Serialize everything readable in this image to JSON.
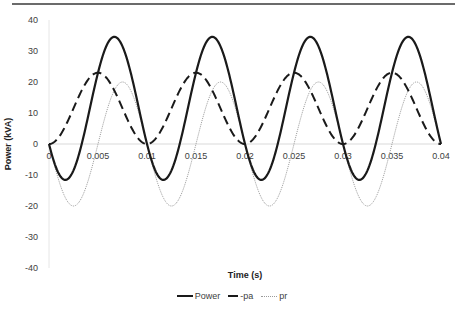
{
  "chart_data": {
    "type": "line",
    "title": "",
    "xlabel": "Time (s)",
    "ylabel": "Power (kVA)",
    "xlim": [
      0,
      0.04
    ],
    "ylim": [
      -40,
      40
    ],
    "x_ticks": [
      "0",
      "0.005",
      "0.01",
      "0.015",
      "0.02",
      "0.025",
      "0.03",
      "0.035",
      "0.04"
    ],
    "y_ticks": [
      "40",
      "30",
      "20",
      "10",
      "0",
      "-10",
      "-20",
      "-30",
      "-40"
    ],
    "grid": false,
    "legend_position": "bottom",
    "period_s": 0.01,
    "series": [
      {
        "name": "Power",
        "style": "solid",
        "color": "#1a1a1a",
        "width": 2.2,
        "description": "pa + pr; peaks ~34.5 at t≈0.0067+k·0.01, min ~-11.6 at t≈0.0017+k·0.01",
        "x": [
          0,
          0.0017,
          0.0042,
          0.0067,
          0.0092,
          0.01,
          0.0117,
          0.0142,
          0.0167,
          0.0192,
          0.02,
          0.0217,
          0.0242,
          0.0267,
          0.0292,
          0.03,
          0.0317,
          0.0342,
          0.0367,
          0.0392,
          0.04
        ],
        "values": [
          0,
          -11.6,
          11.5,
          34.6,
          11.5,
          0,
          -11.6,
          11.5,
          34.6,
          11.5,
          0,
          -11.6,
          11.5,
          34.6,
          11.5,
          0,
          -11.6,
          11.5,
          34.6,
          11.5,
          0
        ]
      },
      {
        "name": "-pa",
        "style": "dashed",
        "color": "#1a1a1a",
        "width": 2,
        "description": "11.5·(1−cos(2πt/0.01)); peak 23 at t=0.005+k·0.01",
        "x": [
          0,
          0.0025,
          0.005,
          0.0075,
          0.01,
          0.0125,
          0.015,
          0.0175,
          0.02,
          0.0225,
          0.025,
          0.0275,
          0.03,
          0.0325,
          0.035,
          0.0375,
          0.04
        ],
        "values": [
          0,
          11.5,
          23,
          11.5,
          0,
          11.5,
          23,
          11.5,
          0,
          11.5,
          23,
          11.5,
          0,
          11.5,
          23,
          11.5,
          0
        ]
      },
      {
        "name": "pr",
        "style": "dotted",
        "color": "#9a9a9a",
        "width": 1,
        "description": "−20·sin(2πt/0.01); min -20 at t=0.0025+k·0.01, max 20 at t=0.0075+k·0.01",
        "x": [
          0,
          0.0025,
          0.005,
          0.0075,
          0.01,
          0.0125,
          0.015,
          0.0175,
          0.02,
          0.0225,
          0.025,
          0.0275,
          0.03,
          0.0325,
          0.035,
          0.0375,
          0.04
        ],
        "values": [
          0,
          -20,
          0,
          20,
          0,
          -20,
          0,
          20,
          0,
          -20,
          0,
          20,
          0,
          -20,
          0,
          20,
          0
        ]
      }
    ],
    "model": {
      "pa_amp": 11.5,
      "pr_amp": 20
    }
  },
  "legend": {
    "items": [
      {
        "label": "Power"
      },
      {
        "label": "-pa"
      },
      {
        "label": "pr"
      }
    ]
  },
  "colors": {
    "axis": "#d9d9d9",
    "text": "#404040",
    "rule": "#6b6b6b"
  }
}
